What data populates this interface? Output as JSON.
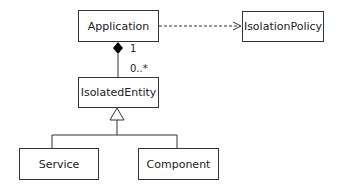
{
  "classes": {
    "application": "Application",
    "isolation_policy": "IsolationPolicy",
    "isolated_entity": "IsolatedEntity",
    "service": "Service",
    "component": "Component"
  },
  "relationships": {
    "composition": {
      "from": "Application",
      "to": "IsolatedEntity",
      "source_multiplicity": "1",
      "target_multiplicity": "0..*"
    },
    "dependency": {
      "from": "Application",
      "to": "IsolationPolicy"
    },
    "generalization": {
      "parent": "IsolatedEntity",
      "children": [
        "Service",
        "Component"
      ]
    }
  }
}
